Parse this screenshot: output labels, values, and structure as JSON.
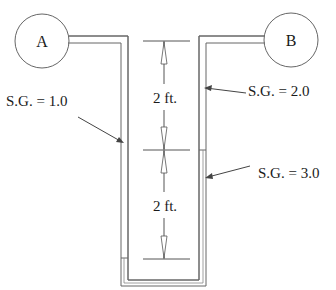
{
  "diagram": {
    "type": "differential-manometer",
    "containers": [
      {
        "id": "A",
        "label": "A"
      },
      {
        "id": "B",
        "label": "B"
      }
    ],
    "fluids": [
      {
        "label": "S.G. = 1.0",
        "location": "left leg"
      },
      {
        "label": "S.G. = 2.0",
        "location": "right leg upper"
      },
      {
        "label": "S.G. = 3.0",
        "location": "right leg lower / U-bottom"
      }
    ],
    "dimensions": [
      {
        "label": "2 ft.",
        "segment": "upper"
      },
      {
        "label": "2 ft.",
        "segment": "lower"
      }
    ],
    "colors": {
      "line": "#555555",
      "text": "#1a1a1a",
      "background": "#ffffff"
    }
  }
}
